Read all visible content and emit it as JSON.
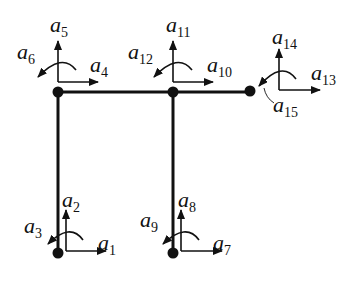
{
  "diagram": {
    "type": "frame-structure-dof",
    "colors": {
      "line": "#111111",
      "background": "#ffffff"
    },
    "nodes": [
      {
        "id": "n1",
        "x": 58,
        "y": 252
      },
      {
        "id": "n2",
        "x": 173,
        "y": 252
      },
      {
        "id": "n3",
        "x": 58,
        "y": 92
      },
      {
        "id": "n4",
        "x": 173,
        "y": 92
      },
      {
        "id": "n5",
        "x": 250,
        "y": 91
      }
    ],
    "members": [
      {
        "from": "n1",
        "to": "n3"
      },
      {
        "from": "n2",
        "to": "n4"
      },
      {
        "from": "n3",
        "to": "n5"
      }
    ],
    "labels": {
      "a1": {
        "base": "a",
        "sub": "1"
      },
      "a2": {
        "base": "a",
        "sub": "2"
      },
      "a3": {
        "base": "a",
        "sub": "3"
      },
      "a4": {
        "base": "a",
        "sub": "4"
      },
      "a5": {
        "base": "a",
        "sub": "5"
      },
      "a6": {
        "base": "a",
        "sub": "6"
      },
      "a7": {
        "base": "a",
        "sub": "7"
      },
      "a8": {
        "base": "a",
        "sub": "8"
      },
      "a9": {
        "base": "a",
        "sub": "9"
      },
      "a10": {
        "base": "a",
        "sub": "10"
      },
      "a11": {
        "base": "a",
        "sub": "11"
      },
      "a12": {
        "base": "a",
        "sub": "12"
      },
      "a13": {
        "base": "a",
        "sub": "13"
      },
      "a14": {
        "base": "a",
        "sub": "14"
      },
      "a15": {
        "base": "a",
        "sub": "15"
      }
    }
  }
}
